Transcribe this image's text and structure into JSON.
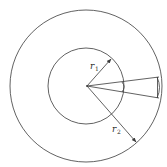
{
  "figure": {
    "labels": {
      "r1": {
        "main": "r",
        "sub": "1"
      },
      "r2": {
        "main": "r",
        "sub": "2"
      }
    },
    "colors": {
      "line": "#3a3a3a",
      "background": "#ffffff"
    }
  }
}
